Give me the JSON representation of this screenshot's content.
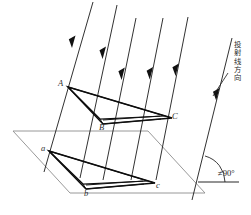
{
  "figure": {
    "background_color": "#ffffff",
    "line_color": "#0d0d0d",
    "plane_color": "#8d8d8d",
    "annotation_color": "#232323"
  },
  "labels": {
    "object_vertex_a": "A",
    "object_vertex_b": "B",
    "object_vertex_c": "C",
    "projection_vertex_a": "a",
    "projection_vertex_b": "b",
    "projection_vertex_c": "c"
  },
  "annotations": {
    "direction_text": "投射线方向",
    "direction_chars": [
      "投",
      "射",
      "线",
      "方",
      "向"
    ],
    "angle_text": "≠90°"
  },
  "geometry": {
    "rays": [
      {
        "name": "ray-through-A-a",
        "x1": 93,
        "y1": 2,
        "x2": 44,
        "y2": 172
      },
      {
        "name": "ray-2",
        "x1": 117,
        "y1": 5,
        "x2": 80,
        "y2": 178
      },
      {
        "name": "ray-3",
        "x1": 136,
        "y1": 18,
        "x2": 103,
        "y2": 180
      },
      {
        "name": "ray-4",
        "x1": 163,
        "y1": 18,
        "x2": 131,
        "y2": 180
      },
      {
        "name": "ray-through-C-c",
        "x1": 188,
        "y1": 17,
        "x2": 156,
        "y2": 180
      },
      {
        "name": "ray-angle-reference",
        "x1": 232,
        "y1": 38,
        "x2": 192,
        "y2": 200
      }
    ],
    "object_triangle": [
      [
        68,
        87
      ],
      [
        103,
        124
      ],
      [
        172,
        118
      ]
    ],
    "projection_triangle": [
      [
        49,
        151
      ],
      [
        86,
        189
      ],
      [
        155,
        183
      ]
    ],
    "plane": [
      [
        13,
        131
      ],
      [
        148,
        131
      ],
      [
        205,
        193
      ],
      [
        70,
        193
      ]
    ],
    "angle_vertex": [
      198,
      182
    ],
    "angle_degrees_marked": "≠90°"
  }
}
